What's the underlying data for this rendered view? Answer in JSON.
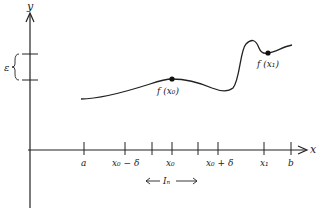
{
  "figure": {
    "axes": {
      "x_label": "x",
      "y_label": "y"
    },
    "epsilon_label": "ε",
    "x_ticks": [
      {
        "label": "a",
        "x": 84
      },
      {
        "label": "x₀ − δ",
        "x": 125
      },
      {
        "label": "",
        "x": 152
      },
      {
        "label": "x₀",
        "x": 172
      },
      {
        "label": "",
        "x": 198
      },
      {
        "label": "x₀ + δ",
        "x": 218
      },
      {
        "label": "x₁",
        "x": 264
      },
      {
        "label": "b",
        "x": 291
      }
    ],
    "interval_label": "Iₙ",
    "points": [
      {
        "label": "f (x₀)",
        "x": 172,
        "y": 79
      },
      {
        "label": "f (x₁)",
        "x": 268,
        "y": 53
      }
    ],
    "colors": {
      "stroke": "#222222",
      "background": "#ffffff"
    }
  }
}
